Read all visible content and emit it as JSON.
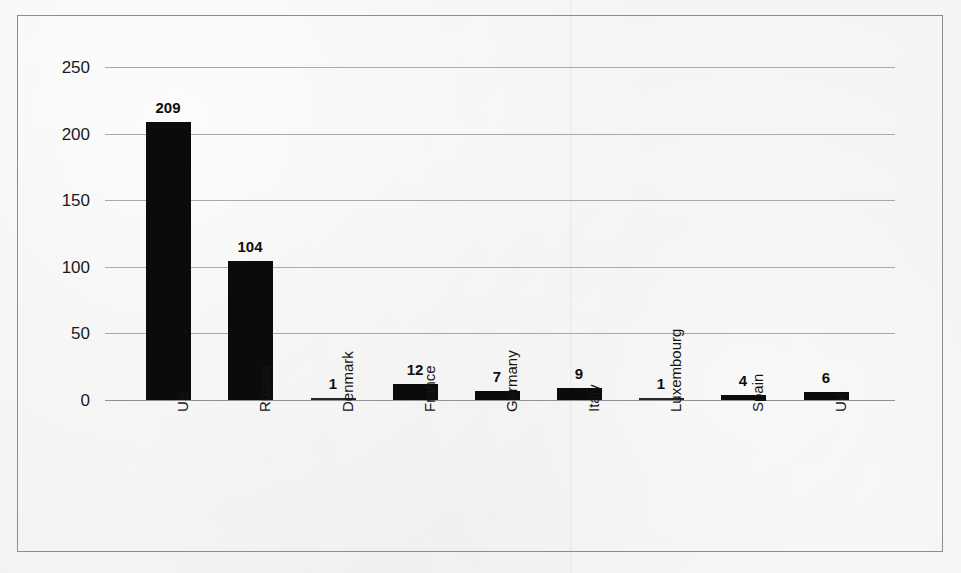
{
  "chart_data": {
    "type": "bar",
    "title": "",
    "subtitle": "",
    "xlabel": "",
    "ylabel": "",
    "categories": [
      "US",
      "Russia",
      "Denmark",
      "France",
      "Germany",
      "Italy",
      "Luxembourg",
      "Spain",
      "UK"
    ],
    "values": [
      209,
      104,
      1,
      12,
      7,
      9,
      1,
      4,
      6
    ],
    "value_labels": [
      "209",
      "104",
      "1",
      "12",
      "7",
      "9",
      "1",
      "4",
      "6"
    ],
    "ylim": [
      0,
      250
    ],
    "ytick_values": [
      0,
      50,
      100,
      150,
      200,
      250
    ],
    "ytick_labels": [
      "0",
      "50",
      "100",
      "150",
      "200",
      "250"
    ],
    "grid": "horizontal",
    "legend": "none",
    "orientation": "vertical",
    "bar_color": "#0b0b0b",
    "gridline_color": "#a8a9ab",
    "background_color": "#f2f2f1",
    "frame_color": "#8b8d90",
    "x_tick_label_rotation": -90,
    "data_labels_shown": true
  },
  "page": {
    "background_color": "#f2f2f1",
    "ghost_text": [
      "",
      "",
      ""
    ]
  }
}
